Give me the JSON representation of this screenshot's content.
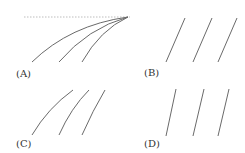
{
  "figure": {
    "panels": [
      {
        "id": "A",
        "label": "(A)",
        "description": "three curves converging at a common point on a dashed horizontal reference line"
      },
      {
        "id": "B",
        "label": "(B)",
        "description": "three parallel straight slanted lines"
      },
      {
        "id": "C",
        "label": "(C)",
        "description": "three parallel curved lines"
      },
      {
        "id": "D",
        "label": "(D)",
        "description": "three parallel straight slanted lines"
      }
    ],
    "colors": {
      "line": "#6a6a6a",
      "reference_line": "#bdbdbd",
      "label": "#333333"
    }
  }
}
